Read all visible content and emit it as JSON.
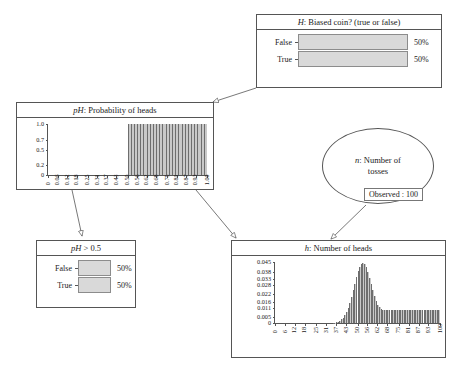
{
  "diagram": {
    "accent": "#d9d9d9",
    "line_color": "#555555"
  },
  "nodes": {
    "h_biased": {
      "title": "H: Biased coin? (true or false)",
      "title_italic": "H",
      "title_rest": ": Biased coin? (true or false)",
      "rows": [
        {
          "label": "False",
          "pct": "50%",
          "value": 50
        },
        {
          "label": "True",
          "pct": "50%",
          "value": 50
        }
      ]
    },
    "ph_gt": {
      "title": "pH > 0.5",
      "title_italic": "pH",
      "title_rest": " > 0.5",
      "rows": [
        {
          "label": "False",
          "pct": "50%",
          "value": 50
        },
        {
          "label": "True",
          "pct": "50%",
          "value": 50
        }
      ]
    },
    "n_tosses": {
      "line1": "n: Number of",
      "line2": "tosses",
      "italic": "n",
      "rest": ": Number of",
      "observed": "Observed : 100"
    }
  },
  "chart_data": [
    {
      "id": "ph_probability_of_heads",
      "type": "bar",
      "title": "pH: Probability of heads",
      "title_italic": "pH",
      "title_rest": ": Probability of heads",
      "xlabel": "",
      "ylabel": "",
      "ylim": [
        0,
        1.0
      ],
      "yticks": [
        "0",
        "0.2",
        "0.5",
        "0.7",
        "1.0"
      ],
      "ytick_values": [
        0,
        0.2,
        0.5,
        0.7,
        1.0
      ],
      "xticks": [
        "0",
        "0.06",
        "0.12",
        "0.18",
        "0.25",
        "0.31",
        "0.37",
        "0.43",
        "0.50",
        "0.56",
        "0.62",
        "0.68",
        "0.75",
        "0.81",
        "0.87",
        "0.93",
        "1.00"
      ],
      "xtick_values": [
        0,
        0.06,
        0.12,
        0.18,
        0.25,
        0.31,
        0.37,
        0.43,
        0.5,
        0.56,
        0.62,
        0.68,
        0.75,
        0.81,
        0.87,
        0.93,
        1.0
      ],
      "grid": false,
      "note": "Uniform density over pH in [0.50, 1.00]; zero below 0.50",
      "x": [
        0.0,
        0.02,
        0.04,
        0.06,
        0.08,
        0.1,
        0.12,
        0.14,
        0.16,
        0.18,
        0.2,
        0.22,
        0.24,
        0.26,
        0.28,
        0.3,
        0.32,
        0.34,
        0.36,
        0.38,
        0.4,
        0.42,
        0.44,
        0.46,
        0.48,
        0.5,
        0.52,
        0.54,
        0.56,
        0.58,
        0.6,
        0.62,
        0.64,
        0.66,
        0.68,
        0.7,
        0.72,
        0.74,
        0.76,
        0.78,
        0.8,
        0.82,
        0.84,
        0.86,
        0.88,
        0.9,
        0.92,
        0.94,
        0.96,
        0.98
      ],
      "values": [
        0,
        0,
        0,
        0,
        0,
        0,
        0,
        0,
        0,
        0,
        0,
        0,
        0,
        0,
        0,
        0,
        0,
        0,
        0,
        0,
        0,
        0,
        0,
        0,
        0,
        1.0,
        1.0,
        1.0,
        1.0,
        1.0,
        1.0,
        1.0,
        1.0,
        1.0,
        1.0,
        1.0,
        1.0,
        1.0,
        1.0,
        1.0,
        1.0,
        1.0,
        1.0,
        1.0,
        1.0,
        1.0,
        1.0,
        1.0,
        1.0,
        1.0
      ]
    },
    {
      "id": "h_number_of_heads",
      "type": "bar",
      "title": "h: Number of heads",
      "title_italic": "h",
      "title_rest": ": Number of heads",
      "xlabel": "",
      "ylabel": "",
      "ylim": [
        0,
        0.045
      ],
      "yticks": [
        "0",
        "0.005",
        "0.011",
        "0.016",
        "0.022",
        "0.028",
        "0.033",
        "0.038",
        "0.045"
      ],
      "ytick_values": [
        0,
        0.005,
        0.011,
        0.016,
        0.022,
        0.028,
        0.033,
        0.038,
        0.045
      ],
      "xticks": [
        "0",
        "6",
        "12",
        "18",
        "25",
        "31",
        "37",
        "43",
        "50",
        "56",
        "62",
        "68",
        "75",
        "81",
        "87",
        "93",
        "100"
      ],
      "xtick_values": [
        0,
        6,
        12,
        18,
        25,
        31,
        37,
        43,
        50,
        56,
        62,
        68,
        75,
        81,
        87,
        93,
        100
      ],
      "grid": false,
      "note": "Mixture: binomial(100,0.5) peak near 50 plus uniform tail from ~50 to 100",
      "x": [
        0,
        1,
        2,
        3,
        4,
        5,
        6,
        7,
        8,
        9,
        10,
        11,
        12,
        13,
        14,
        15,
        16,
        17,
        18,
        19,
        20,
        21,
        22,
        23,
        24,
        25,
        26,
        27,
        28,
        29,
        30,
        31,
        32,
        33,
        34,
        35,
        36,
        37,
        38,
        39,
        40,
        41,
        42,
        43,
        44,
        45,
        46,
        47,
        48,
        49,
        50,
        51,
        52,
        53,
        54,
        55,
        56,
        57,
        58,
        59,
        60,
        61,
        62,
        63,
        64,
        65,
        66,
        67,
        68,
        69,
        70,
        71,
        72,
        73,
        74,
        75,
        76,
        77,
        78,
        79,
        80,
        81,
        82,
        83,
        84,
        85,
        86,
        87,
        88,
        89,
        90,
        91,
        92,
        93,
        94,
        95,
        96,
        97,
        98,
        99,
        100
      ],
      "values": [
        0,
        0,
        0,
        0,
        0,
        0,
        0,
        0,
        0,
        0,
        0,
        0,
        0,
        0,
        0,
        0,
        0,
        0,
        0,
        0,
        0,
        0,
        0,
        0,
        0,
        0,
        0,
        0,
        0,
        0,
        0,
        0,
        0,
        0,
        0,
        0.0002,
        0.0004,
        0.0007,
        0.0012,
        0.0019,
        0.0029,
        0.0043,
        0.0062,
        0.0086,
        0.0116,
        0.0153,
        0.0196,
        0.0243,
        0.0293,
        0.0342,
        0.0385,
        0.0419,
        0.044,
        0.0446,
        0.0437,
        0.0414,
        0.0379,
        0.0337,
        0.0291,
        0.0245,
        0.0203,
        0.0166,
        0.0136,
        0.0118,
        0.0107,
        0.0101,
        0.0098,
        0.0096,
        0.0095,
        0.0095,
        0.0095,
        0.0095,
        0.0095,
        0.0095,
        0.0095,
        0.0095,
        0.0095,
        0.0095,
        0.0095,
        0.0095,
        0.0095,
        0.0095,
        0.0095,
        0.0095,
        0.0095,
        0.0095,
        0.0095,
        0.0095,
        0.0095,
        0.0095,
        0.0095,
        0.0095,
        0.0095,
        0.0095,
        0.0095,
        0.0095,
        0.0095,
        0.0095,
        0.0095,
        0.0097
      ]
    }
  ]
}
